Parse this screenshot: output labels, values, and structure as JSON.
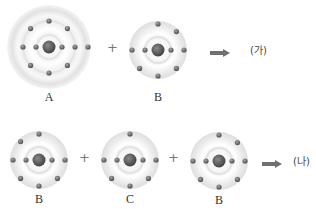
{
  "reactions": [
    {
      "id": "reaction-1",
      "reactants": [
        {
          "label": "A",
          "inner_electrons": 2,
          "outer_electrons": 8,
          "shells": 2
        },
        {
          "label": "B",
          "inner_electrons": 2,
          "outer_electrons": 7,
          "shells": 2
        }
      ],
      "operator": "+",
      "product_label": "(가)"
    },
    {
      "id": "reaction-2",
      "reactants": [
        {
          "label": "B",
          "inner_electrons": 2,
          "outer_electrons": 7,
          "shells": 2
        },
        {
          "label": "C",
          "inner_electrons": 2,
          "outer_electrons": 6,
          "shells": 2
        },
        {
          "label": "B",
          "inner_electrons": 2,
          "outer_electrons": 7,
          "shells": 2
        }
      ],
      "operator": "+",
      "product_label": "(나)"
    }
  ],
  "labels": {
    "r1_a": "A",
    "r1_b": "B",
    "r1_plus": "+",
    "r1_product": "(가)",
    "r2_b1": "B",
    "r2_c": "C",
    "r2_b2": "B",
    "r2_plus1": "+",
    "r2_plus2": "+",
    "r2_product": "(나)"
  },
  "icons": {
    "arrow": "right-arrow-icon",
    "nucleus": "nucleus-icon",
    "electron": "electron-icon"
  },
  "colors": {
    "nucleus": "#555555",
    "electron": "#6a6a6a",
    "shell_glow": "#e6e6e6",
    "arrow": "#707070"
  }
}
